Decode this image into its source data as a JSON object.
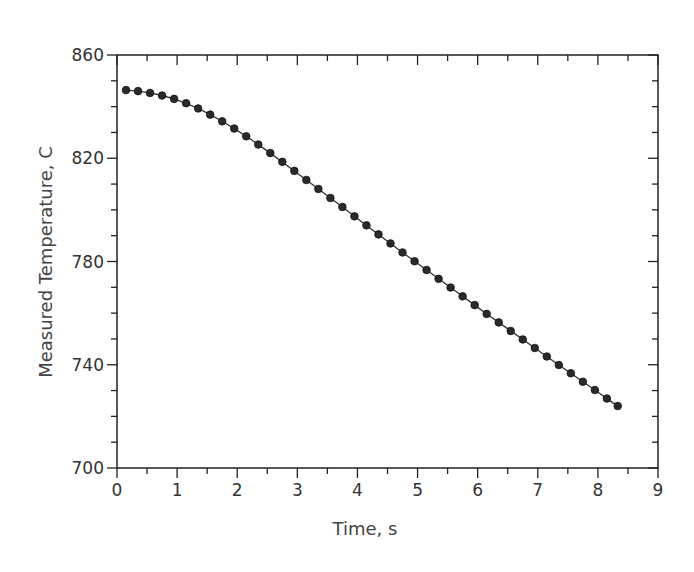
{
  "chart_data": {
    "type": "line",
    "title": "",
    "xlabel": "Time, s",
    "ylabel": "Measured Temperature, C",
    "xlim": [
      0,
      9
    ],
    "ylim": [
      700,
      860
    ],
    "x_ticks": [
      "0",
      "1",
      "2",
      "3",
      "4",
      "5",
      "6",
      "7",
      "8",
      "9"
    ],
    "y_ticks": [
      "700",
      "740",
      "780",
      "820",
      "860"
    ],
    "grid": false,
    "legend": null,
    "marker": "filled-circle",
    "series": [
      {
        "name": "Measured Temperature",
        "x": [
          0.15,
          0.35,
          0.55,
          0.75,
          0.95,
          1.15,
          1.35,
          1.55,
          1.75,
          1.95,
          2.15,
          2.35,
          2.55,
          2.75,
          2.95,
          3.15,
          3.35,
          3.55,
          3.75,
          3.95,
          4.15,
          4.35,
          4.55,
          4.75,
          4.95,
          5.15,
          5.35,
          5.55,
          5.75,
          5.95,
          6.15,
          6.35,
          6.55,
          6.75,
          6.95,
          7.15,
          7.35,
          7.55,
          7.75,
          7.95,
          8.15,
          8.33
        ],
        "y": [
          846.4,
          846.0,
          845.3,
          844.3,
          843.0,
          841.3,
          839.3,
          836.9,
          834.3,
          831.5,
          828.5,
          825.3,
          822.0,
          818.6,
          815.1,
          811.6,
          808.1,
          804.6,
          801.1,
          797.5,
          794.0,
          790.5,
          787.0,
          783.5,
          780.1,
          776.7,
          773.3,
          769.9,
          766.5,
          763.1,
          759.7,
          756.4,
          753.1,
          749.8,
          746.5,
          743.2,
          739.9,
          736.7,
          733.4,
          730.2,
          726.9,
          724.0
        ]
      }
    ]
  }
}
